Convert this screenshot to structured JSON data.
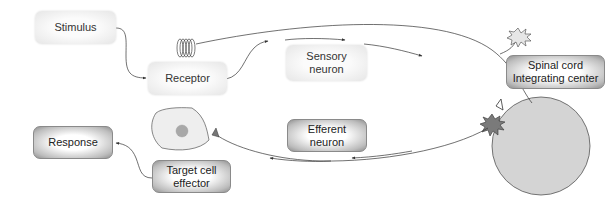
{
  "nodes": {
    "stimulus": {
      "label": "Stimulus"
    },
    "receptor": {
      "label": "Receptor"
    },
    "sensory_neuron": {
      "lines": [
        "Sensory",
        "neuron"
      ]
    },
    "integrating_center": {
      "lines": [
        "Spinal cord",
        "Integrating center"
      ]
    },
    "efferent_neuron": {
      "lines": [
        "Efferent",
        "neuron"
      ]
    },
    "target_cell": {
      "lines": [
        "Target cell",
        "effector"
      ]
    },
    "response": {
      "label": "Response"
    }
  },
  "colors": {
    "spinal_cord_fill": "#d4d4d4",
    "neuron_body_fill": "#7a7a7a",
    "sensory_body_fill": "#e6e6e6",
    "cell_fill": "#eeeeee",
    "nucleus_fill": "#a8a8a8",
    "line": "#333333"
  }
}
